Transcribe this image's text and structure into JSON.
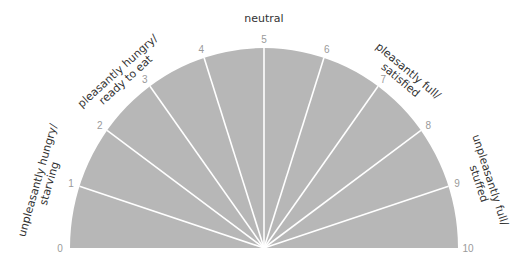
{
  "title": "neutral",
  "colors": {
    "fill": "#b7b7b7",
    "spoke": "#ffffff",
    "number": "#9a9a9a",
    "label": "#333333"
  },
  "numbers": [
    "0",
    "1",
    "2",
    "3",
    "4",
    "5",
    "6",
    "7",
    "8",
    "9",
    "10"
  ],
  "zones": [
    {
      "line1": "unpleasantly hungry/",
      "line2": "starving"
    },
    {
      "line1": "pleasantly hungry/",
      "line2": "ready to eat"
    },
    {
      "line1": "pleasantly full/",
      "line2": "satisfied"
    },
    {
      "line1": "unpleasantly full/",
      "line2": "stuffed"
    }
  ]
}
